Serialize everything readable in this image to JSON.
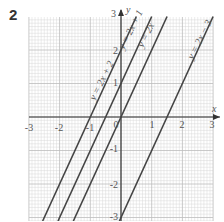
{
  "question_number": "2",
  "chart_data": {
    "type": "line",
    "title": "",
    "xlabel": "x",
    "ylabel": "y",
    "xlim": [
      -3,
      3
    ],
    "ylim": [
      -3,
      3
    ],
    "grid": true,
    "x_ticks": [
      "-3",
      "-2",
      "-1",
      "0",
      "1",
      "2",
      "3"
    ],
    "y_ticks": [
      "3",
      "2",
      "1",
      "-1",
      "-2",
      "-3"
    ],
    "series": [
      {
        "name": "y = 2x + 2",
        "slope": 2,
        "intercept": 2
      },
      {
        "name": "y = 2x + 1",
        "slope": 2,
        "intercept": 1
      },
      {
        "name": "y = 2x",
        "slope": 2,
        "intercept": 0
      },
      {
        "name": "y = 2x - 3",
        "slope": 2,
        "intercept": -3
      }
    ],
    "line_color": "#444444",
    "grid_color": "#d9d9d9"
  },
  "labels": {
    "x_axis": "x",
    "y_axis": "y",
    "origin": "0",
    "x_neg3": "-3",
    "x_neg2": "-2",
    "x_neg1": "-1",
    "x_1": "1",
    "x_2": "2",
    "x_3": "3",
    "y_3": "3",
    "y_2": "2",
    "y_1": "1",
    "y_neg1": "-1",
    "y_neg2": "-2",
    "y_neg3": "-3",
    "line1": "y = 2x + 2",
    "line2": "y = 2x + 1",
    "line3": "y = 2x",
    "line4": "y = 2x − 3"
  }
}
